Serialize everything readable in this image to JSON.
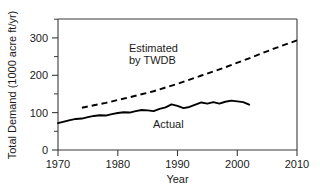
{
  "chart_data": {
    "type": "line",
    "title": "",
    "xlabel": "Year",
    "ylabel": "Total Demand (1000 acre ft/yr)",
    "xlim": [
      1970,
      2010
    ],
    "ylim": [
      0,
      350
    ],
    "xticks": [
      1970,
      1980,
      1990,
      2000,
      2010
    ],
    "yticks": [
      0,
      100,
      200,
      300
    ],
    "yticks_minor": [
      50,
      150,
      250,
      350
    ],
    "grid": false,
    "legend_position": "inline-annotations",
    "annotations": [
      {
        "text": "Estimated",
        "x": 1987,
        "y": 236
      },
      {
        "text": "by TWDB",
        "x": 1987,
        "y": 215
      },
      {
        "text": "Actual",
        "x": 1992,
        "y": 62
      }
    ],
    "series": [
      {
        "name": "Actual",
        "style": "solid",
        "x": [
          1970,
          1971,
          1972,
          1973,
          1974,
          1975,
          1976,
          1977,
          1978,
          1979,
          1980,
          1981,
          1982,
          1983,
          1984,
          1985,
          1986,
          1987,
          1988,
          1989,
          1990,
          1991,
          1992,
          1993,
          1994,
          1995,
          1996,
          1997,
          1998,
          1999,
          2000,
          2001,
          2002
        ],
        "y": [
          72,
          76,
          80,
          83,
          84,
          88,
          91,
          93,
          92,
          96,
          99,
          101,
          100,
          104,
          107,
          106,
          104,
          110,
          114,
          122,
          118,
          112,
          115,
          121,
          127,
          124,
          128,
          124,
          129,
          132,
          130,
          128,
          121
        ]
      },
      {
        "name": "Estimated by TWDB",
        "style": "dashed",
        "x": [
          1974,
          1978,
          1982,
          1986,
          1990,
          1994,
          1998,
          2002,
          2006,
          2010
        ],
        "y": [
          113,
          126,
          141,
          157,
          177,
          199,
          221,
          245,
          270,
          293
        ]
      }
    ]
  },
  "axis_labels": {
    "x_title": "Year",
    "y_title": "Total Demand (1000 acre ft/yr)",
    "x_tick_texts": [
      "1970",
      "1980",
      "1990",
      "2000",
      "2010"
    ],
    "y_tick_texts": [
      "0",
      "100",
      "200",
      "300"
    ]
  },
  "annotations_text": {
    "estimated_line1": "Estimated",
    "estimated_line2": "by TWDB",
    "actual": "Actual"
  },
  "colors": {
    "line": "#000000",
    "axis": "#3b3b3b",
    "text": "#1a1a1a",
    "background": "#ffffff"
  }
}
